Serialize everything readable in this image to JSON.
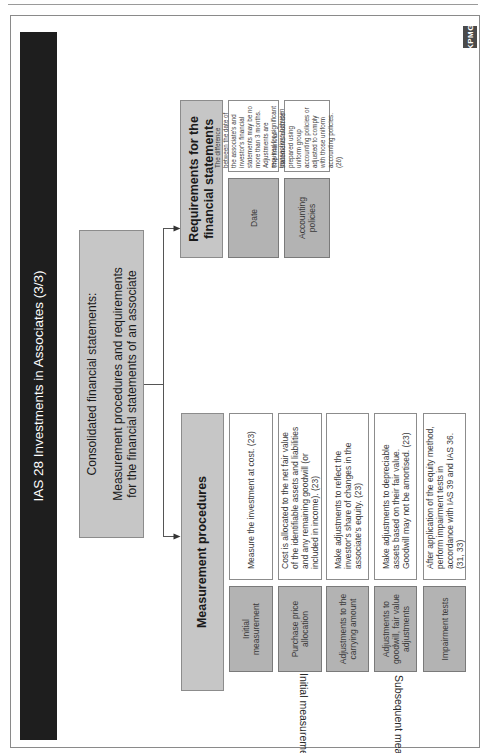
{
  "page": {
    "title": "IAS 28 Investments in Associates (3/3)",
    "logo_text": "KPMG"
  },
  "root": {
    "title": "Consolidated financial statements:",
    "subtitle": "Measurement procedures and requirements for the financial statements of an associate"
  },
  "measurement": {
    "header": "Measurement procedures",
    "rows": [
      {
        "label": "Initial measurement",
        "text": "Measure the investment at cost. (23)"
      },
      {
        "label": "Purchase price allocation",
        "text": "Cost is allocated to the net fair value of the identifiable assets and liabilities and any remaining goodwill (or included in income). (23)"
      },
      {
        "label": "Adjustments to the carrying amount",
        "text": "Make adjustments to reflect the investor's share of changes in the associate's equity. (23)"
      },
      {
        "label": "Adjustments to goodwill, fair value adjustments",
        "text": "Make adjustments to depreciable assets based on their fair value. Goodwill may not be amortised. (23)"
      },
      {
        "label": "Impairment tests",
        "text": "After application of the equity method, perform impairment tests in accordance with IAS 39 and IAS 36. (31, 33)"
      }
    ],
    "group_labels": {
      "initial": "Initial measurement",
      "subsequent": "Subsequent measurement"
    }
  },
  "requirements": {
    "header": "Requirements for the financial statements",
    "rows": [
      {
        "label": "Date",
        "text": "The difference between the date of the associate's and investor's financial statements may be no more than 3 months. Adjustments are required for significant transactions between the dates. (25)"
      },
      {
        "label": "Accounting policies",
        "text": "The financial statements must be prepared using uniform group accounting policies or adjusted to comply with those uniform accounting policies. (26)"
      }
    ]
  },
  "colors": {
    "title_bar": "#1e1e1e",
    "box_gray": "#c6c6c6",
    "label_gray": "#b3b3b3"
  }
}
